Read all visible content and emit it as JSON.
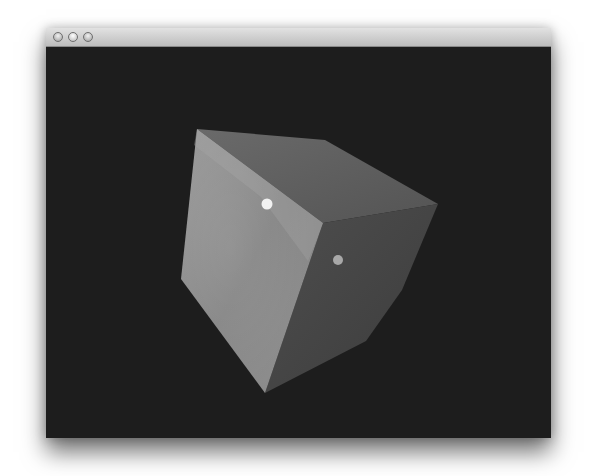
{
  "window": {
    "title": "",
    "controls": [
      {
        "name": "close",
        "icon": "close-circle-icon"
      },
      {
        "name": "minimize",
        "icon": "minimize-circle-icon"
      },
      {
        "name": "zoom",
        "icon": "zoom-circle-icon"
      }
    ]
  },
  "viewport": {
    "background_color": "#1d1d1d",
    "scene": {
      "object": "cube",
      "faces": [
        {
          "name": "left-face",
          "color": "#8e8e8e"
        },
        {
          "name": "top-face",
          "color": "#5e5e5e"
        },
        {
          "name": "right-face",
          "color": "#464646"
        }
      ],
      "markers": [
        {
          "name": "white-dot",
          "color": "#f2f2f2"
        },
        {
          "name": "grey-dot",
          "color": "#a8a8a8"
        }
      ]
    }
  }
}
